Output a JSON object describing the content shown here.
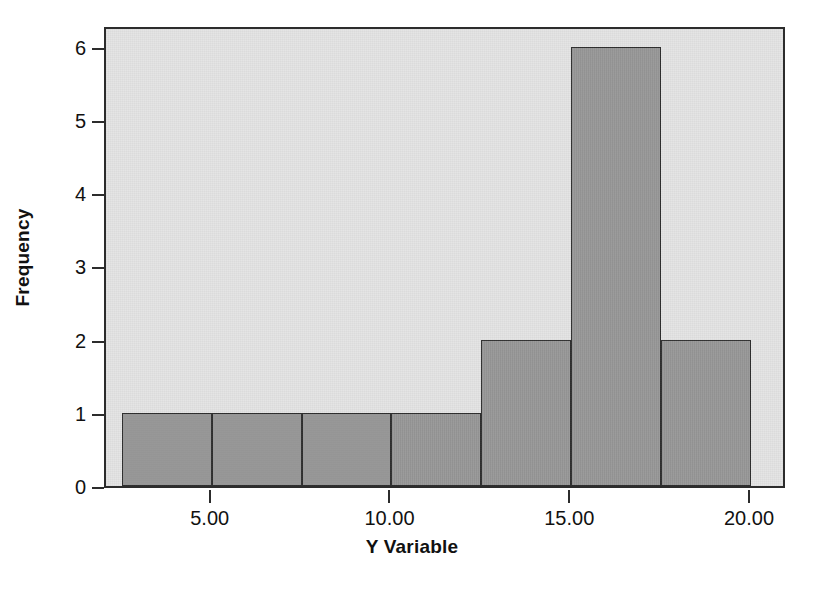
{
  "chart_data": {
    "type": "bar",
    "title": "",
    "xlabel": "Y Variable",
    "ylabel": "Frequency",
    "xlim": [
      2.06,
      21.0
    ],
    "ylim": [
      0,
      6.3
    ],
    "grid": false,
    "legend": null,
    "bin_width": 2.5,
    "bin_edges": [
      2.5,
      5.0,
      7.5,
      10.0,
      12.5,
      15.0,
      17.5,
      20.0
    ],
    "categories": [
      "2.50-5.00",
      "5.00-7.50",
      "7.50-10.00",
      "10.00-12.50",
      "12.50-15.00",
      "15.00-17.50",
      "17.50-20.00"
    ],
    "values": [
      1,
      1,
      1,
      1,
      2,
      6,
      2
    ],
    "bin_centers": [
      3.75,
      6.25,
      8.75,
      11.25,
      13.75,
      16.25,
      18.75
    ],
    "xticks": [
      5,
      10,
      15,
      20
    ],
    "xtick_labels": [
      "5.00",
      "10.00",
      "15.00",
      "20.00"
    ],
    "yticks": [
      0,
      1,
      2,
      3,
      4,
      5,
      6
    ],
    "ytick_labels": [
      "0",
      "1",
      "2",
      "3",
      "4",
      "5",
      "6"
    ],
    "total_count": 14,
    "colors": {
      "bar_fill": "#9a9a9a",
      "bar_edge": "#2f2f2f",
      "panel_background": "#e4e4e4",
      "frame": "#2c2c2c",
      "text": "#111111",
      "figure_background": "#ffffff"
    }
  }
}
